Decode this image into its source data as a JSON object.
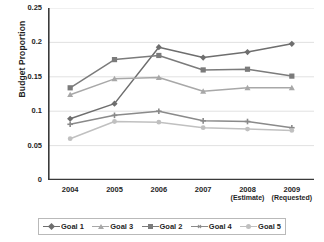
{
  "chart_data": {
    "type": "line",
    "title": "",
    "xlabel": "",
    "ylabel": "Budget Proportion",
    "categories": [
      "2004",
      "2005",
      "2006",
      "2007",
      "2008",
      "2009"
    ],
    "category_sublabels": [
      "",
      "",
      "",
      "",
      "(Estimate)",
      "(Requested)"
    ],
    "ylim": [
      0,
      0.25
    ],
    "yticks": [
      0,
      0.05,
      0.1,
      0.15,
      0.2,
      0.25
    ],
    "ytick_labels": [
      "0",
      "0.05",
      "0.1",
      "0.15",
      "0.2",
      "0.25"
    ],
    "grid": "horizontal",
    "legend_position": "bottom",
    "legend_order": [
      "Goal 1",
      "Goal 3",
      "Goal 2",
      "Goal 4",
      "Goal 5"
    ],
    "series": [
      {
        "name": "Goal 1",
        "marker": "diamond",
        "color": "#6e6e6e",
        "values": [
          0.089,
          0.111,
          0.193,
          0.178,
          0.186,
          0.198
        ]
      },
      {
        "name": "Goal 3",
        "marker": "triangle",
        "color": "#a8a8a8",
        "values": [
          0.124,
          0.147,
          0.149,
          0.129,
          0.134,
          0.134
        ]
      },
      {
        "name": "Goal 2",
        "marker": "square",
        "color": "#7b7b7b",
        "values": [
          0.134,
          0.175,
          0.181,
          0.16,
          0.161,
          0.151
        ]
      },
      {
        "name": "Goal 4",
        "marker": "cross",
        "color": "#8a8a8a",
        "values": [
          0.081,
          0.094,
          0.1,
          0.086,
          0.085,
          0.076
        ]
      },
      {
        "name": "Goal 5",
        "marker": "circle",
        "color": "#c0c0c0",
        "values": [
          0.06,
          0.085,
          0.084,
          0.076,
          0.074,
          0.072
        ]
      }
    ]
  },
  "axis": {
    "y_title": "Budget Proportion"
  },
  "colors": {
    "axis": "#3a3a3a",
    "grid": "#d9d9d9",
    "text": "#1f1f1f",
    "legend_border": "#b9b9b9",
    "background": "#ffffff"
  }
}
